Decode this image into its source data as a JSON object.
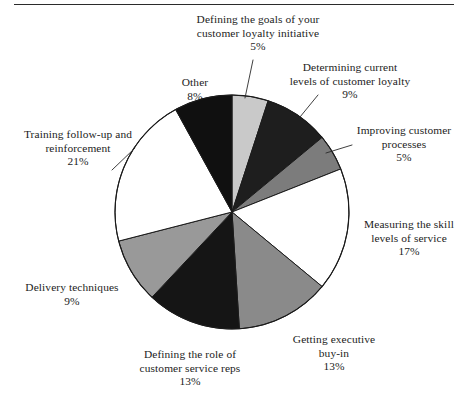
{
  "figure": {
    "has_top_rule": true,
    "background_color": "#ffffff",
    "text_color": "#1c1c1c"
  },
  "chart_data": {
    "type": "pie",
    "title": "",
    "subtitle": "",
    "xlabel": "",
    "ylabel": "",
    "legend_position": "none",
    "grid": false,
    "units": "percent",
    "start_angle_deg": 0,
    "direction": "clockwise",
    "total": 100,
    "categories": [
      "Defining the goals of your customer loyalty initiative",
      "Determining current levels of customer loyalty",
      "Improving customer processes",
      "Measuring the skill levels of service",
      "Getting executive buy-in",
      "Defining the role of customer service reps",
      "Delivery techniques",
      "Training follow-up and reinforcement",
      "Other"
    ],
    "values": [
      5,
      9,
      5,
      17,
      13,
      13,
      9,
      21,
      8
    ],
    "colors": [
      "#c9c9c9",
      "#1e1e1e",
      "#7c7c7c",
      "#ffffff",
      "#8a8a8a",
      "#151515",
      "#999999",
      "#ffffff",
      "#101010"
    ],
    "slices": [
      {
        "label_lines": [
          "Defining the goals of your",
          "customer loyalty initiative"
        ],
        "value": 5,
        "value_text": "5%",
        "color": "#c9c9c9",
        "leader": true
      },
      {
        "label_lines": [
          "Determining current",
          "levels of customer loyalty"
        ],
        "value": 9,
        "value_text": "9%",
        "color": "#1e1e1e",
        "leader": true
      },
      {
        "label_lines": [
          "Improving customer",
          "processes"
        ],
        "value": 5,
        "value_text": "5%",
        "color": "#7c7c7c",
        "leader": true
      },
      {
        "label_lines": [
          "Measuring the skill",
          "levels of service"
        ],
        "value": 17,
        "value_text": "17%",
        "color": "#ffffff",
        "leader": false
      },
      {
        "label_lines": [
          "Getting executive",
          "buy-in"
        ],
        "value": 13,
        "value_text": "13%",
        "color": "#8a8a8a",
        "leader": false
      },
      {
        "label_lines": [
          "Defining the role of",
          "customer service reps"
        ],
        "value": 13,
        "value_text": "13%",
        "color": "#151515",
        "leader": false
      },
      {
        "label_lines": [
          "Delivery techniques"
        ],
        "value": 9,
        "value_text": "9%",
        "color": "#999999",
        "leader": false
      },
      {
        "label_lines": [
          "Training follow-up and",
          "reinforcement"
        ],
        "value": 21,
        "value_text": "21%",
        "color": "#ffffff",
        "leader": true
      },
      {
        "label_lines": [
          "Other"
        ],
        "value": 8,
        "value_text": "8%",
        "color": "#101010",
        "leader": false
      }
    ]
  },
  "labels": {
    "goals": {
      "line1": "Defining the goals of your",
      "line2": "customer loyalty initiative",
      "pct": "5%"
    },
    "determining": {
      "line1": "Determining current",
      "line2": "levels of customer loyalty",
      "pct": "9%"
    },
    "improving": {
      "line1": "Improving customer",
      "line2": "processes",
      "pct": "5%"
    },
    "measuring": {
      "line1": "Measuring the skill",
      "line2": "levels of service",
      "pct": "17%"
    },
    "getting": {
      "line1": "Getting executive",
      "line2": "buy-in",
      "pct": "13%"
    },
    "defining_role": {
      "line1": "Defining the role of",
      "line2": "customer service reps",
      "pct": "13%"
    },
    "delivery": {
      "line1": "Delivery techniques",
      "pct": "9%"
    },
    "training": {
      "line1": "Training follow-up and",
      "line2": "reinforcement",
      "pct": "21%"
    },
    "other": {
      "line1": "Other",
      "pct": "8%"
    }
  }
}
